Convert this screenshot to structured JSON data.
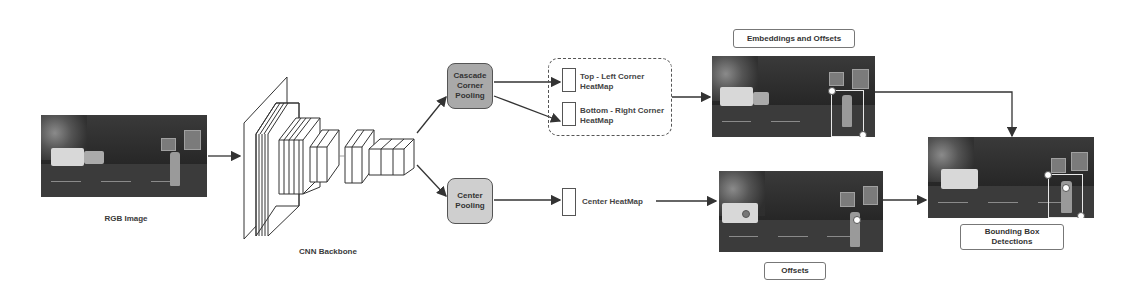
{
  "diagram": {
    "nodes": {
      "input": {
        "label": "RGB Image"
      },
      "backbone": {
        "label": "CNN Backbone"
      },
      "cascade_pool": {
        "label": "Cascade Corner Pooling",
        "fill": "#a9a9a9"
      },
      "center_pool": {
        "label": "Center Pooling",
        "fill": "#cfcfcf"
      },
      "tl_heatmap": {
        "label": "Top - Left Corner HeatMap"
      },
      "br_heatmap": {
        "label": "Bottom - Right Corner HeatMap"
      },
      "center_heatmap": {
        "label": "Center HeatMap"
      },
      "embeddings": {
        "label": "Embeddings and Offsets"
      },
      "offsets": {
        "label": "Offsets"
      },
      "output": {
        "label": "Bounding Box Detections"
      }
    },
    "edges": [
      {
        "from": "input",
        "to": "backbone"
      },
      {
        "from": "backbone",
        "to": "cascade_pool"
      },
      {
        "from": "backbone",
        "to": "center_pool"
      },
      {
        "from": "cascade_pool",
        "to": "tl_heatmap"
      },
      {
        "from": "cascade_pool",
        "to": "br_heatmap"
      },
      {
        "from": "corner_heatmaps",
        "to": "embeddings"
      },
      {
        "from": "center_pool",
        "to": "center_heatmap"
      },
      {
        "from": "center_heatmap",
        "to": "offsets"
      },
      {
        "from": "embeddings",
        "to": "output"
      },
      {
        "from": "offsets",
        "to": "output"
      }
    ]
  },
  "labels": {
    "rgb_image": "RGB Image",
    "cnn_backbone": "CNN Backbone",
    "cascade_line1": "Cascade",
    "cascade_line2": "Corner",
    "cascade_line3": "Pooling",
    "center_line1": "Center",
    "center_line2": "Pooling",
    "tl_line1": "Top - Left Corner",
    "tl_line2": "HeatMap",
    "br_line1": "Bottom - Right Corner",
    "br_line2": "HeatMap",
    "center_heatmap": "Center HeatMap",
    "embeddings_offsets": "Embeddings and Offsets",
    "offsets": "Offsets",
    "bbox_line1": "Bounding Box",
    "bbox_line2": "Detections"
  },
  "colors": {
    "line": "#333333",
    "cascade_fill": "#a9a9a9",
    "center_fill": "#cfcfcf"
  }
}
